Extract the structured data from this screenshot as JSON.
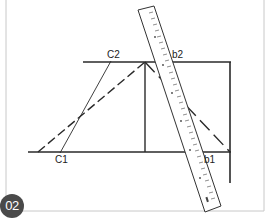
{
  "figure": {
    "number_badge": "02",
    "labels": {
      "c1": "C1",
      "c2": "C2",
      "b1": "b1",
      "b2": "b2"
    },
    "colors": {
      "line": "#2a2a2a",
      "frame": "#c8c8c8",
      "badge_bg": "#4a4a4a",
      "badge_text": "#ffffff",
      "ruler_fill": "#ffffff",
      "ruler_stroke": "#333333"
    },
    "ruler": {
      "description": "measuring ruler placed diagonally across diagram"
    }
  }
}
